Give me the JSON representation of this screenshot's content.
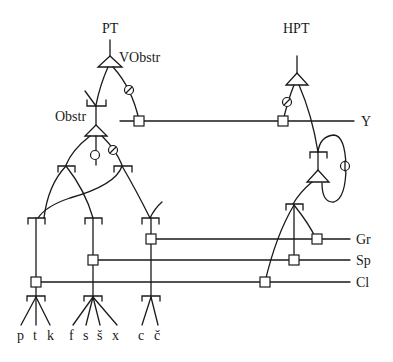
{
  "diagram": {
    "left_tree": {
      "title": "PT",
      "root_node_label": "VObstr",
      "sub_node_label": "Obstr",
      "leaves": {
        "labial": [
          "p",
          "t",
          "k"
        ],
        "fricative": [
          "f",
          "s",
          "š",
          "x"
        ],
        "affricate": [
          "c",
          "č"
        ]
      }
    },
    "right_tree": {
      "title": "HPT"
    },
    "tiers": [
      {
        "id": "Y",
        "label": "Y"
      },
      {
        "id": "Gr",
        "label": "Gr"
      },
      {
        "id": "Sp",
        "label": "Sp"
      },
      {
        "id": "Cl",
        "label": "Cl"
      }
    ],
    "symbols": {
      "triangle": "node-triangle",
      "square": "tier-association-box",
      "circle": "null-marker-circle",
      "bracket": "branching-bracket"
    },
    "colors": {
      "ink": "#1a1a1a",
      "background": "#ffffff"
    }
  }
}
